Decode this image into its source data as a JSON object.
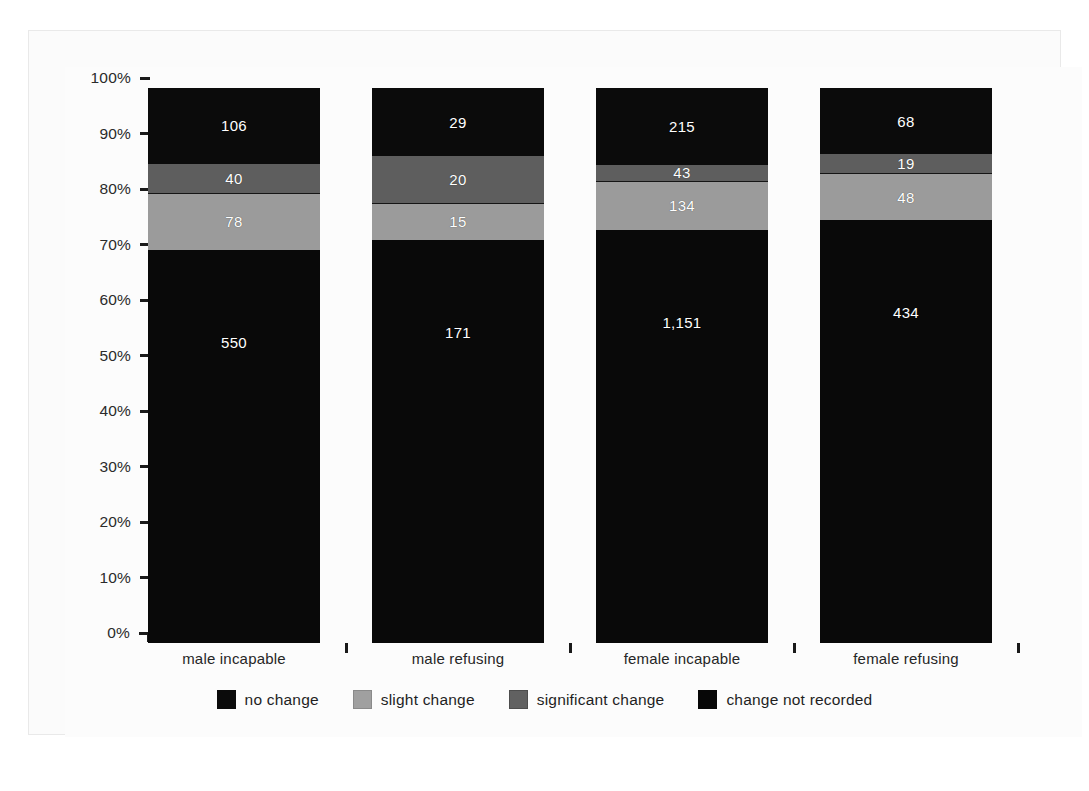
{
  "chart_data": {
    "type": "bar",
    "subtype": "stacked-percentage",
    "title": "",
    "xlabel": "",
    "ylabel": "",
    "ylim": [
      0,
      100
    ],
    "grid": false,
    "legend_position": "bottom",
    "y_tick_labels": [
      "100%",
      "90%",
      "80%",
      "70%",
      "60%",
      "50%",
      "40%",
      "30%",
      "20%",
      "10%",
      "0%"
    ],
    "y_tick_values": [
      100,
      90,
      80,
      70,
      60,
      50,
      40,
      30,
      20,
      10,
      0
    ],
    "categories": [
      "male incapable",
      "male refusing",
      "female incapable",
      "female refusing"
    ],
    "series": [
      {
        "name": "no change",
        "color": "#0b0b0b",
        "values": [
          550,
          171,
          1151,
          434
        ],
        "labels": [
          "550",
          "171",
          "1,151",
          "434"
        ],
        "percentages": [
          71.1,
          72.8,
          74.6,
          76.3
        ]
      },
      {
        "name": "slight change",
        "color": "#9b9b9b",
        "values": [
          78,
          15,
          134,
          48
        ],
        "labels": [
          "78",
          "15",
          "134",
          "48"
        ],
        "percentages": [
          10.1,
          6.4,
          8.7,
          8.4
        ]
      },
      {
        "name": "significant change",
        "color": "#5e5e5e",
        "values": [
          40,
          20,
          43,
          19
        ],
        "labels": [
          "40",
          "20",
          "43",
          "19"
        ],
        "percentages": [
          5.2,
          8.5,
          2.8,
          3.3
        ]
      },
      {
        "name": "change not recorded",
        "color": "#070707",
        "values": [
          106,
          29,
          215,
          68
        ],
        "labels": [
          "106",
          "29",
          "215",
          "68"
        ],
        "percentages": [
          13.7,
          12.3,
          13.9,
          12.0
        ]
      }
    ],
    "totals": [
      774,
      235,
      1543,
      569
    ]
  },
  "legend": {
    "items": [
      {
        "label": "no change",
        "swatch": "s-nochange"
      },
      {
        "label": "slight change",
        "swatch": "s-slight"
      },
      {
        "label": "significant change",
        "swatch": "s-signif"
      },
      {
        "label": "change not recorded",
        "swatch": "s-notrec"
      }
    ]
  }
}
